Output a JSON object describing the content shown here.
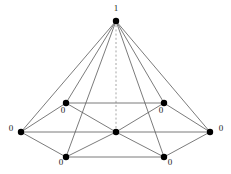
{
  "figure": {
    "type": "graph-diagram",
    "width": 231,
    "height": 174,
    "background_color": "#ffffff",
    "edge_color": "#595959",
    "axis_color": "#a6a6a6",
    "node_color": "#000000",
    "label_color": "#1a1a1a",
    "node_radius": 3.2,
    "edge_width": 0.8
  },
  "nodes": [
    {
      "id": "apex",
      "name": "apex-node",
      "x": 116,
      "y": 21,
      "label": "1",
      "label_x": 116,
      "label_y": 8,
      "label_anchor": "middle"
    },
    {
      "id": "left",
      "name": "left-node",
      "x": 21,
      "y": 132,
      "label": "0",
      "label_x": 11,
      "label_y": 128,
      "label_anchor": "middle"
    },
    {
      "id": "right",
      "name": "right-node",
      "x": 210,
      "y": 132,
      "label": "0",
      "label_x": 221,
      "label_y": 128,
      "label_anchor": "middle"
    },
    {
      "id": "upper-left",
      "name": "upper-left-node",
      "x": 66,
      "y": 103,
      "label": "0",
      "label_x": 63,
      "label_y": 110,
      "label_anchor": "middle"
    },
    {
      "id": "upper-right",
      "name": "upper-right-node",
      "x": 164,
      "y": 103,
      "label": "0",
      "label_x": 161,
      "label_y": 110,
      "label_anchor": "middle"
    },
    {
      "id": "lower-left",
      "name": "lower-left-node",
      "x": 66,
      "y": 157,
      "label": "0",
      "label_x": 61,
      "label_y": 162,
      "label_anchor": "middle"
    },
    {
      "id": "lower-right",
      "name": "lower-right-node",
      "x": 164,
      "y": 157,
      "label": "0",
      "label_x": 170,
      "label_y": 162,
      "label_anchor": "middle"
    },
    {
      "id": "center",
      "name": "center-node",
      "x": 116,
      "y": 132,
      "label": "",
      "label_x": 116,
      "label_y": 132,
      "label_anchor": "middle"
    }
  ],
  "edges": [
    {
      "from": "apex",
      "to": "left",
      "style": "solid"
    },
    {
      "from": "apex",
      "to": "upper-left",
      "style": "solid"
    },
    {
      "from": "apex",
      "to": "lower-left",
      "style": "solid"
    },
    {
      "from": "apex",
      "to": "lower-right",
      "style": "solid"
    },
    {
      "from": "apex",
      "to": "upper-right",
      "style": "solid"
    },
    {
      "from": "apex",
      "to": "right",
      "style": "solid"
    },
    {
      "from": "apex",
      "to": "center",
      "style": "dashed"
    },
    {
      "from": "left",
      "to": "upper-left",
      "style": "solid"
    },
    {
      "from": "left",
      "to": "lower-left",
      "style": "solid"
    },
    {
      "from": "left",
      "to": "center",
      "style": "solid"
    },
    {
      "from": "right",
      "to": "upper-right",
      "style": "solid"
    },
    {
      "from": "right",
      "to": "lower-right",
      "style": "solid"
    },
    {
      "from": "right",
      "to": "center",
      "style": "solid"
    },
    {
      "from": "upper-left",
      "to": "upper-right",
      "style": "solid"
    },
    {
      "from": "lower-left",
      "to": "lower-right",
      "style": "solid"
    },
    {
      "from": "upper-left",
      "to": "center",
      "style": "solid"
    },
    {
      "from": "upper-right",
      "to": "center",
      "style": "solid"
    },
    {
      "from": "lower-left",
      "to": "center",
      "style": "solid"
    },
    {
      "from": "lower-right",
      "to": "center",
      "style": "solid"
    }
  ]
}
